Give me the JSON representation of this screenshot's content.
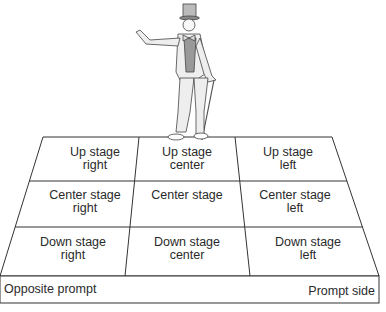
{
  "diagram": {
    "grid": [
      [
        "Up stage right",
        "Up stage center",
        "Up stage left"
      ],
      [
        "Center stage right",
        "Center stage",
        "Center stage left"
      ],
      [
        "Down stage right",
        "Down stage center",
        "Down stage left"
      ]
    ],
    "cells": {
      "usr": {
        "l1": "Up stage",
        "l2": "right"
      },
      "usc": {
        "l1": "Up stage",
        "l2": "center"
      },
      "usl": {
        "l1": "Up stage",
        "l2": "left"
      },
      "csr": {
        "l1": "Center stage",
        "l2": "right"
      },
      "cs": {
        "l1": "Center stage",
        "l2": ""
      },
      "csl": {
        "l1": "Center stage",
        "l2": "left"
      },
      "dsr": {
        "l1": "Down stage",
        "l2": "right"
      },
      "dsc": {
        "l1": "Down stage",
        "l2": "center"
      },
      "dsl": {
        "l1": "Down stage",
        "l2": "left"
      }
    },
    "front_left": "Opposite prompt",
    "front_right": "Prompt side",
    "figure": "actor in top hat with cane"
  }
}
